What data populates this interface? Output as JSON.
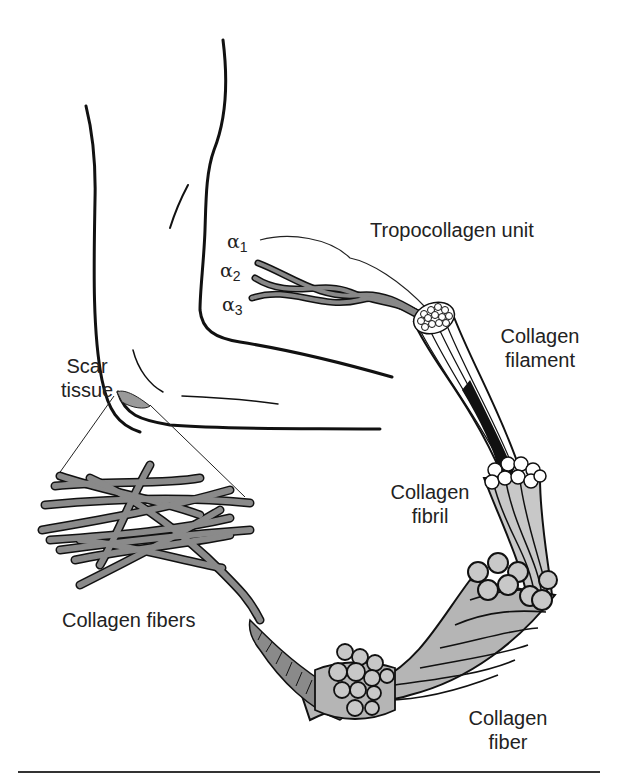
{
  "diagram": {
    "labels": {
      "scar_tissue": [
        "Scar",
        "tissue"
      ],
      "tropocollagen_unit": "Tropocollagen unit",
      "collagen_filament": [
        "Collagen",
        "filament"
      ],
      "collagen_fibril": [
        "Collagen",
        "fibril"
      ],
      "collagen_fibers": "Collagen fibers",
      "collagen_fiber": [
        "Collagen",
        "fiber"
      ]
    },
    "alpha_chains": [
      {
        "symbol": "α",
        "sub": "1"
      },
      {
        "symbol": "α",
        "sub": "2"
      },
      {
        "symbol": "α",
        "sub": "3"
      }
    ],
    "colors": {
      "outline": "#111111",
      "fiber_fill": "#8a8a8a",
      "fiber_light": "#b5b5b5",
      "fibril_fill": "#c8c8c8",
      "background": "#ffffff",
      "rule": "#333333"
    }
  }
}
